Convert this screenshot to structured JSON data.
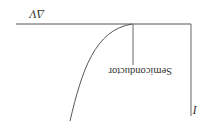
{
  "diagram": {
    "orientation": "rotated-180",
    "axes": {
      "x_label": "I",
      "y_label": "ΔV"
    },
    "curves": [
      {
        "name": "semiconductor-curve",
        "label": "Semiconductor"
      }
    ],
    "colors": {
      "line": "#555555",
      "text": "#333333",
      "background": "#ffffff"
    }
  }
}
